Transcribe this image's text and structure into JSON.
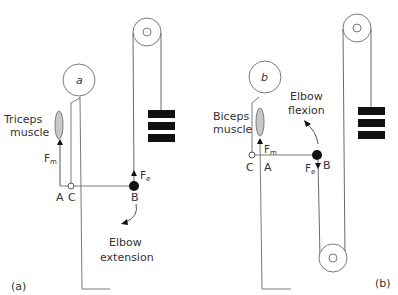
{
  "figure": {
    "panel_a": {
      "panel_label": "(a)",
      "head_label": "a",
      "muscle_label_line1": "Triceps",
      "muscle_label_line2": "muscle",
      "muscle_force": "F",
      "muscle_force_sub": "m",
      "external_force": "F",
      "external_force_sub": "e",
      "point_a": "A",
      "point_b": "B",
      "point_c": "C",
      "motion_line1": "Elbow",
      "motion_line2": "extension"
    },
    "panel_b": {
      "panel_label": "(b)",
      "head_label": "b",
      "muscle_label_line1": "Biceps",
      "muscle_label_line2": "muscle",
      "muscle_force": "F",
      "muscle_force_sub": "m",
      "external_force": "F",
      "external_force_sub": "e",
      "point_a": "A",
      "point_b": "B",
      "point_c": "C",
      "motion_line1": "Elbow",
      "motion_line2": "flexion"
    },
    "colors": {
      "line": "#7a7a7a",
      "weight": "#111111",
      "muscle_fill": "#c8c8c8",
      "text": "#333333"
    }
  }
}
